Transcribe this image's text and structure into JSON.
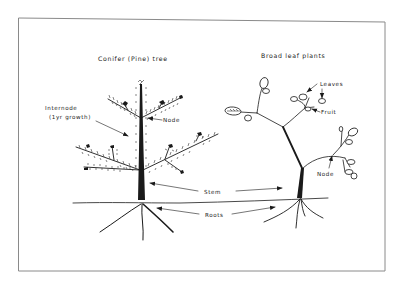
{
  "figure": {
    "frame_color": "#8a8a8a",
    "ink_color": "#1a1a1a",
    "background": "#ffffff"
  },
  "titles": {
    "conifer": "Conifer (Pine) tree",
    "broadleaf": "Broad leaf plants"
  },
  "labels": {
    "internode_line1": "Internode",
    "internode_line2": "(1yr growth)",
    "node_conifer": "Node",
    "leaves": "Leaves",
    "fruit": "Fruit",
    "node_broadleaf": "Node",
    "stem": "Stem",
    "roots": "Roots"
  }
}
